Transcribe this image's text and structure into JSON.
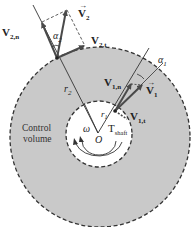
{
  "diagram": {
    "type": "control-volume-turbomachine",
    "colors": {
      "control_volume_fill": "#c9c9c9",
      "inner_fill": "#ffffff",
      "vector": "#4a4a4a",
      "line": "#333333",
      "dashed": "#333333"
    },
    "labels": {
      "control_volume_line1": "Control",
      "control_volume_line2": "volume",
      "omega": "ω",
      "origin": "O",
      "torque": "T",
      "torque_sub": "shaft",
      "r1": "r",
      "r1_sub": "1",
      "r2": "r",
      "r2_sub": "2",
      "alpha1": "α",
      "alpha1_sub": "1",
      "alpha2": "α",
      "alpha2_sub": "2",
      "v1": "V",
      "v1_sub": "1",
      "v1n": "V",
      "v1n_sub": "1,n",
      "v1t": "V",
      "v1t_sub": "1,t",
      "v2": "V",
      "v2_sub": "2",
      "v2n": "V",
      "v2n_sub": "2,n",
      "v2t": "V",
      "v2t_sub": "2,t"
    }
  }
}
